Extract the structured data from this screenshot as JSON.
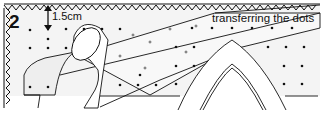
{
  "figure": {
    "step_number": "2",
    "measurement_label": "1.5cm",
    "caption": "transferring the dots",
    "colors": {
      "line": "#111111",
      "fabric_fill": "#f2f2f2",
      "background": "#ffffff"
    }
  }
}
